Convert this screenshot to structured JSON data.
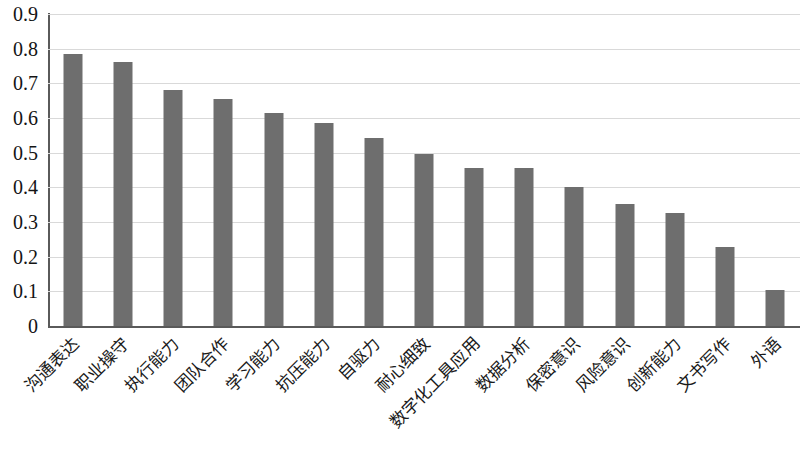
{
  "chart_data": {
    "type": "bar",
    "title": "",
    "subtitle": "",
    "xlabel": "",
    "ylabel": "",
    "ylim": [
      0,
      0.9
    ],
    "grid": true,
    "legend": false,
    "bar_color": "#6e6e6e",
    "gridline_color": "#d9d9d9",
    "axis_color": "#5a5a5a",
    "y_ticks": [
      "0.9",
      "0.8",
      "0.7",
      "0.6",
      "0.5",
      "0.4",
      "0.3",
      "0.2",
      "0.1",
      "0"
    ],
    "y_tick_values": [
      0.9,
      0.8,
      0.7,
      0.6,
      0.5,
      0.4,
      0.3,
      0.2,
      0.1,
      0
    ],
    "categories": [
      "沟通表达",
      "职业操守",
      "执行能力",
      "团队合作",
      "学习能力",
      "抗压能力",
      "自驱力",
      "耐心细致",
      "数字化工具应用",
      "数据分析",
      "保密意识",
      "风险意识",
      "创新能力",
      "文书写作",
      "外语"
    ],
    "values": [
      0.785,
      0.763,
      0.68,
      0.655,
      0.615,
      0.587,
      0.541,
      0.497,
      0.457,
      0.456,
      0.402,
      0.351,
      0.325,
      0.228,
      0.104
    ]
  }
}
